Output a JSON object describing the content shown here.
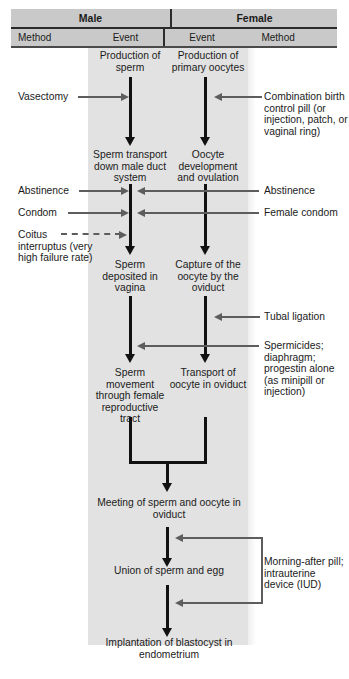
{
  "table_header": {
    "male": "Male",
    "female": "Female",
    "male_method": "Method",
    "male_event": "Event",
    "female_event": "Event",
    "female_method": "Method"
  },
  "colors": {
    "band": "#e2e2e2",
    "header_fill": "#c9c9c9",
    "event_arrow": "#111111",
    "method_arrow": "#5d5d5d",
    "text": "#1b1b1b"
  },
  "male_events": [
    "Production of sperm",
    "Sperm transport down male duct system",
    "Sperm deposited in vagina",
    "Sperm movement through female reproductive tract"
  ],
  "female_events": [
    "Production of primary oocytes",
    "Oocyte development and ovulation",
    "Capture of the oocyte by the oviduct",
    "Transport of oocyte in oviduct"
  ],
  "shared_events": [
    "Meeting of sperm and oocyte in oviduct",
    "Union of sperm and egg",
    "Implantation of blastocyst in endometrium"
  ],
  "male_methods": [
    {
      "label": "Vasectomy",
      "arrow": "solid"
    },
    {
      "label": "Abstinence",
      "arrow": "solid"
    },
    {
      "label": "Condom",
      "arrow": "solid"
    },
    {
      "label": "Coitus interruptus (very high failure rate)",
      "arrow": "dashed"
    }
  ],
  "female_methods": [
    {
      "label": "Combination birth control pill (or injection, patch, or vaginal ring)"
    },
    {
      "label": "Abstinence"
    },
    {
      "label": "Female condom"
    },
    {
      "label": "Tubal ligation"
    },
    {
      "label": "Spermicides; diaphragm; progestin alone (as minipill or injection)"
    },
    {
      "label": "Morning-after pill; intrauterine device (IUD)"
    }
  ]
}
